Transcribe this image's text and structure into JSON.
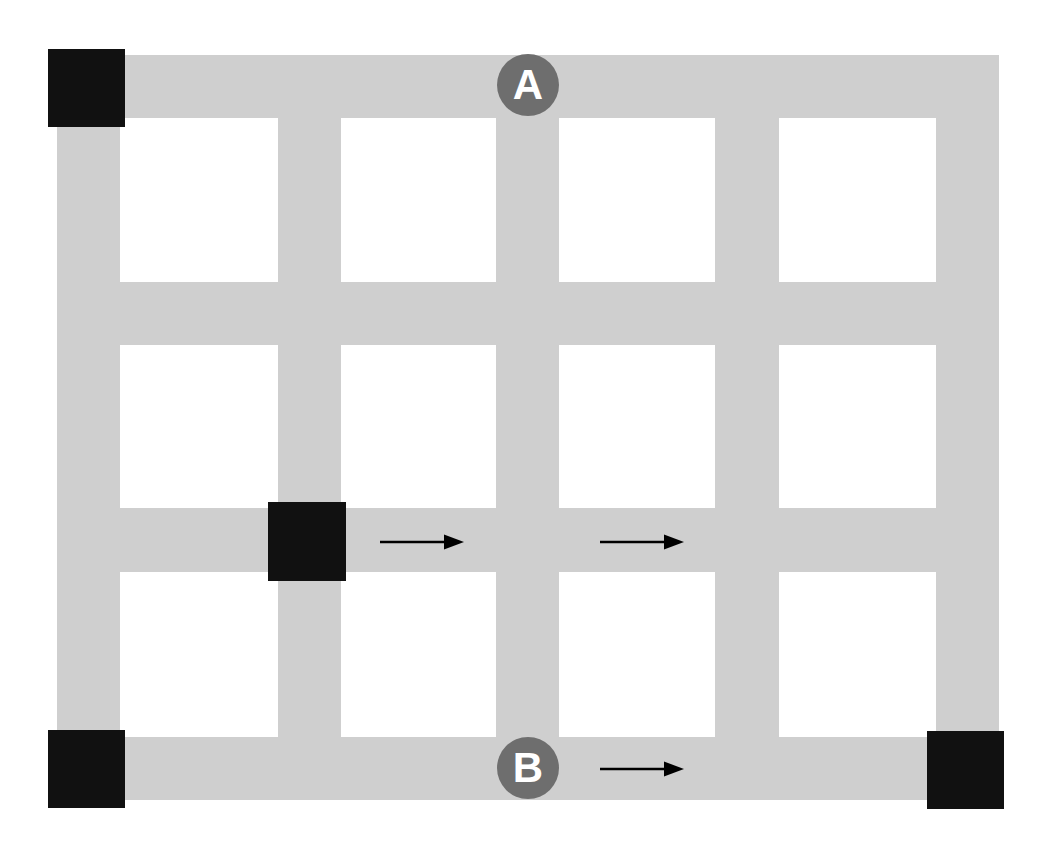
{
  "diagram": {
    "canvas": {
      "width": 1045,
      "height": 853,
      "background": "#ffffff"
    },
    "colors": {
      "road": "#cfcfcf",
      "block": "#ffffff",
      "marker_square": "#111111",
      "node_circle": "#6e6e6e",
      "node_label": "#ffffff",
      "arrow": "#000000"
    },
    "grid": {
      "columns": 4,
      "rows": 3,
      "road_width": 63,
      "vertical_roads_x": [
        57,
        278,
        496,
        715,
        936
      ],
      "horizontal_roads_y": [
        55,
        282,
        508,
        737
      ],
      "bounds": {
        "left": 57,
        "top": 55,
        "right": 999,
        "bottom": 800
      }
    },
    "roads": {
      "vertical": [
        {
          "name": "vertical-road-1",
          "x": 57,
          "y": 55,
          "w": 63,
          "h": 745
        },
        {
          "name": "vertical-road-2",
          "x": 278,
          "y": 55,
          "w": 63,
          "h": 745
        },
        {
          "name": "vertical-road-3",
          "x": 496,
          "y": 55,
          "w": 63,
          "h": 745
        },
        {
          "name": "vertical-road-4",
          "x": 715,
          "y": 55,
          "w": 64,
          "h": 745
        },
        {
          "name": "vertical-road-5",
          "x": 936,
          "y": 55,
          "w": 63,
          "h": 745
        }
      ],
      "horizontal": [
        {
          "name": "horizontal-road-1",
          "x": 57,
          "y": 55,
          "w": 942,
          "h": 63
        },
        {
          "name": "horizontal-road-2",
          "x": 57,
          "y": 282,
          "w": 942,
          "h": 63
        },
        {
          "name": "horizontal-road-3",
          "x": 57,
          "y": 508,
          "w": 942,
          "h": 64
        },
        {
          "name": "horizontal-road-4",
          "x": 57,
          "y": 737,
          "w": 942,
          "h": 63
        }
      ]
    },
    "markers": [
      {
        "id": "marker-top-left",
        "label": "",
        "x": 48,
        "y": 49,
        "w": 77,
        "h": 78,
        "shape": "square",
        "position": "top-left-corner"
      },
      {
        "id": "marker-center",
        "label": "",
        "x": 268,
        "y": 502,
        "w": 78,
        "h": 79,
        "shape": "square",
        "position": "center-intersection"
      },
      {
        "id": "marker-bottom-left",
        "label": "",
        "x": 48,
        "y": 730,
        "w": 77,
        "h": 78,
        "shape": "square",
        "position": "bottom-left-corner"
      },
      {
        "id": "marker-bottom-right",
        "label": "",
        "x": 927,
        "y": 731,
        "w": 77,
        "h": 78,
        "shape": "square",
        "position": "bottom-right-corner"
      }
    ],
    "nodes": [
      {
        "id": "node-a",
        "label": "A",
        "cx": 528,
        "cy": 85,
        "r": 31,
        "font_size": 42
      },
      {
        "id": "node-b",
        "label": "B",
        "cx": 528,
        "cy": 768,
        "r": 31,
        "font_size": 42
      }
    ],
    "arrows": [
      {
        "id": "arrow-1",
        "direction": "right",
        "x": 380,
        "y": 533,
        "length": 82,
        "row": "middle"
      },
      {
        "id": "arrow-2",
        "direction": "right",
        "x": 600,
        "y": 533,
        "length": 82,
        "row": "middle"
      },
      {
        "id": "arrow-3",
        "direction": "right",
        "x": 600,
        "y": 760,
        "length": 82,
        "row": "bottom"
      }
    ]
  }
}
